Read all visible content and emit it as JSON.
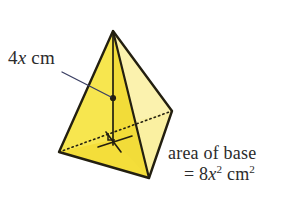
{
  "figure": {
    "shape_name": "square-based pyramid",
    "background_color": "#ffffff",
    "stroke_color": "#231f10",
    "colors": {
      "face_front_left": "#f6e23c",
      "face_front_right": "#f2dc39",
      "face_right_light": "#faf0a1",
      "face_upper_left_highlight": "#f9ea78",
      "outline": "#231f10",
      "leader_line": "#3a3f63",
      "text": "#2b2b2b"
    },
    "vertices": {
      "apex": [
        113,
        31
      ],
      "base_left": [
        59,
        152
      ],
      "base_front": [
        149,
        178
      ],
      "base_right": [
        172,
        111
      ],
      "base_back_hidden": [
        96,
        92
      ],
      "base_center": [
        113,
        140
      ],
      "height_dot": [
        113,
        98
      ]
    },
    "labels": {
      "height": {
        "prefix": "4",
        "variable": "x",
        "unit": "cm",
        "full_text": "4x cm",
        "points_to": "perpendicular height of pyramid"
      },
      "base_area": {
        "line1": "area of base",
        "line2_prefix": "= 8",
        "line2_variable": "x",
        "line2_exponent": "2",
        "line2_unit": "cm",
        "line2_unit_exponent": "2",
        "full_text": "area of base = 8x2 cm2"
      }
    },
    "markers": {
      "right_angle": "right-angle square at base centre",
      "perpendicular_tick": "tick mark on base diagonal",
      "height_point": "solid dot on height line"
    }
  }
}
